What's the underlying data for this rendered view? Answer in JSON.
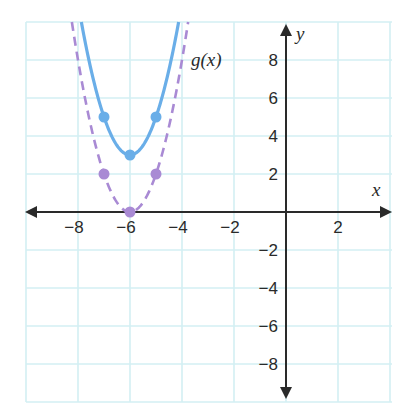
{
  "chart_data": {
    "type": "line",
    "title": "",
    "xlabel": "x",
    "ylabel": "y",
    "xlim": [
      -10,
      4
    ],
    "ylim": [
      -10,
      10
    ],
    "grid": true,
    "grid_step": 2,
    "x_ticks": [
      -8,
      -6,
      -4,
      -2,
      2
    ],
    "y_ticks": [
      8,
      6,
      4,
      2,
      -2,
      -4,
      -6,
      -8
    ],
    "x_tick_labels": [
      "−8",
      "−6",
      "−4",
      "−2",
      "2"
    ],
    "y_tick_labels": [
      "8",
      "6",
      "4",
      "2",
      "−2",
      "−4",
      "−6",
      "−8"
    ],
    "series": [
      {
        "name": "f(x)",
        "label": "",
        "formula": "2(x+6)^2 + 3",
        "a": 2,
        "h": -6,
        "k": 3,
        "style": "solid",
        "color": "#6aaee8",
        "points": [
          {
            "x": -7,
            "y": 5
          },
          {
            "x": -6,
            "y": 3
          },
          {
            "x": -5,
            "y": 5
          }
        ]
      },
      {
        "name": "g(x)",
        "label": "g(x)",
        "formula": "2(x+6)^2",
        "a": 2,
        "h": -6,
        "k": 0,
        "style": "dashed",
        "color": "#a98ad4",
        "points": [
          {
            "x": -7,
            "y": 2
          },
          {
            "x": -6,
            "y": 0
          },
          {
            "x": -5,
            "y": 2
          }
        ]
      }
    ],
    "colors": {
      "grid": "#d3eff3",
      "axis": "#2a2a2a"
    }
  }
}
